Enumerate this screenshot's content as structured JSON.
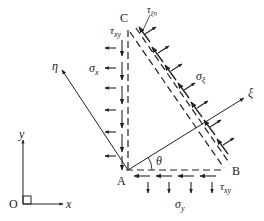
{
  "diagram": {
    "vertices": {
      "A": "A",
      "B": "B",
      "C": "C",
      "O": "O"
    },
    "axes": {
      "x": "x",
      "y": "y",
      "xi": "ξ",
      "eta": "η"
    },
    "angle": "θ",
    "stresses": {
      "sigma_x": "σ",
      "sigma_x_sub": "x",
      "sigma_y": "σ",
      "sigma_y_sub": "y",
      "sigma_xi": "σ",
      "sigma_xi_sub": "ξ",
      "tau_xy_left": "τ",
      "tau_xy_left_sub": "xy",
      "tau_xy_bottom": "τ",
      "tau_xy_bottom_sub": "xy",
      "tau_xieta": "τ",
      "tau_xieta_sub": "ξη"
    },
    "colors": {
      "stroke": "#222222",
      "background": "#ffffff"
    }
  }
}
